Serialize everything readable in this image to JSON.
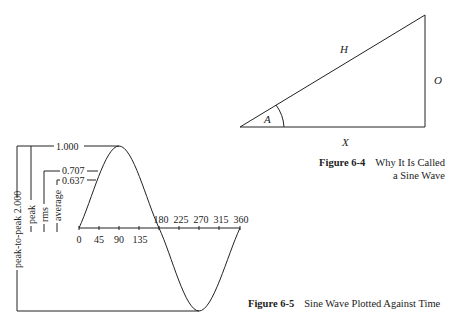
{
  "figure_6_4": {
    "caption_number": "Figure 6-4",
    "caption_text_line1": "Why It Is Called",
    "caption_text_line2": "a Sine Wave",
    "labels": {
      "hypotenuse": "H",
      "opposite": "O",
      "adjacent": "X",
      "angle": "A"
    }
  },
  "figure_6_5": {
    "caption_number": "Figure 6-5",
    "caption_text": "Sine Wave Plotted Against Time",
    "x_ticks": [
      "0",
      "45",
      "90",
      "135",
      "180",
      "225",
      "270",
      "315",
      "360"
    ],
    "levels": {
      "peak_value": "1.000",
      "rms_value": "0.707",
      "average_value": "0.637"
    },
    "bracket_labels": {
      "peak_to_peak": "peak-to-peak 2.000",
      "peak": "peak",
      "rms": "rms",
      "average": "average"
    }
  }
}
